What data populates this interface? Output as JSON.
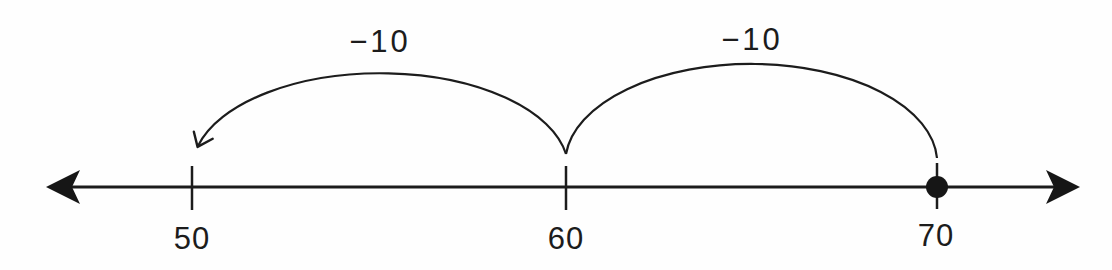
{
  "figure": {
    "type": "number-line-diagram",
    "colors": {
      "ink": "#1c1c1c",
      "background": "#fefefe"
    },
    "number_line": {
      "arrow_left": true,
      "arrow_right": true,
      "ticks": [
        {
          "label": "50"
        },
        {
          "label": "60"
        },
        {
          "label": "70"
        }
      ],
      "point_marker_at": "70"
    },
    "jumps": [
      {
        "label": "−10",
        "from": "60",
        "to": "50",
        "arrowhead_at": "50"
      },
      {
        "label": "−10",
        "from": "70",
        "to": "60",
        "arrowhead_at": null
      }
    ]
  }
}
